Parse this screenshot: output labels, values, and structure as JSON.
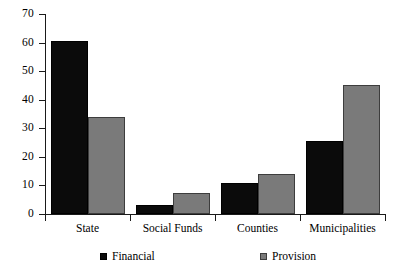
{
  "chart_data": {
    "type": "bar",
    "title": "",
    "subtitle": "",
    "xlabel": "",
    "ylabel": "",
    "grid": false,
    "legend_position": "bottom-center",
    "ylim": [
      0,
      70
    ],
    "yticks": [
      0,
      10,
      20,
      30,
      40,
      50,
      60,
      70
    ],
    "ytick_labels": [
      "0",
      "10",
      "20",
      "30",
      "40",
      "50",
      "60",
      "70"
    ],
    "categories": [
      "State",
      "Social Funds",
      "Counties",
      "Municipalities"
    ],
    "series": [
      {
        "name": "Financial",
        "color": "#0b0b0b",
        "values": [
          60.5,
          3,
          11,
          25.5
        ]
      },
      {
        "name": "Provision",
        "color": "#7a7a7a",
        "values": [
          34,
          7.5,
          14,
          45
        ]
      }
    ]
  },
  "legend": {
    "items": [
      {
        "label": "Financial",
        "swatch": "financial-swatch"
      },
      {
        "label": "Provision",
        "swatch": "provision-swatch"
      }
    ]
  }
}
